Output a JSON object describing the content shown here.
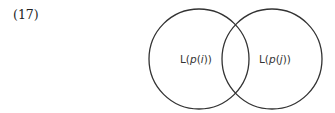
{
  "example_number": "(17)",
  "venn": {
    "left_set": {
      "prefix": "L(",
      "var": "p",
      "open": "(",
      "arg": "i",
      "close": "))"
    },
    "right_set": {
      "prefix": "L(",
      "var": "p",
      "open": "(",
      "arg": "j",
      "close": "))"
    },
    "stroke_color": "#333333"
  }
}
